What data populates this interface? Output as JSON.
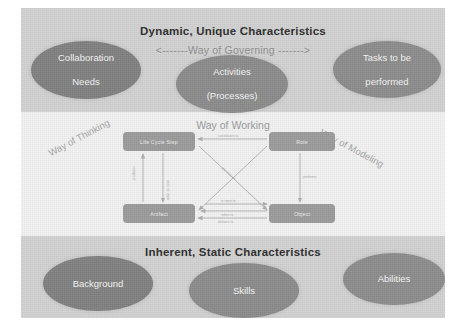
{
  "figure": {
    "bands": [
      {
        "id": "dynamic",
        "title": "Dynamic, Unique Characteristics"
      },
      {
        "id": "middle",
        "title": ""
      },
      {
        "id": "inherent",
        "title": "Inherent, Static Characteristics"
      }
    ],
    "axis_labels": {
      "governing": "<-------Way of Governing ------->",
      "working": "Way of Working",
      "thinking": "Way of Thinking",
      "modeling": "Way of Modeling"
    },
    "top_ellipses": [
      {
        "name": "collaboration-needs",
        "label": "Collaboration Needs",
        "line1": "Collaboration",
        "line2": "Needs",
        "color": "#7f7f7f"
      },
      {
        "name": "activities",
        "label": "Activities (Processes)",
        "line1": "Activities",
        "line2": "(Processes)",
        "color": "#8a8a8a"
      },
      {
        "name": "tasks",
        "label": "Tasks to be performed",
        "line1": "Tasks to be",
        "line2": "performed",
        "color": "#8b8b8b"
      }
    ],
    "bottom_ellipses": [
      {
        "name": "background",
        "label": "Background",
        "color": "#7f7f7f"
      },
      {
        "name": "skills",
        "label": "Skills",
        "color": "#8a8a8a"
      },
      {
        "name": "abilities",
        "label": "Abilities",
        "color": "#8b8b8b"
      }
    ],
    "inner_diagram": {
      "nodes": [
        {
          "name": "life-cycle-step",
          "label": "Life Cycle Step"
        },
        {
          "name": "role",
          "label": "Role"
        },
        {
          "name": "artifact",
          "label": "Artifact"
        },
        {
          "name": "object",
          "label": "Object"
        }
      ],
      "edge_labels": [
        "contributes to",
        "produces",
        "uses as input",
        "performs",
        "operates on",
        "is input to",
        "refers to",
        "delivers to"
      ]
    },
    "colors": {
      "page_background": "#ffffff",
      "band_outer": "#d2d2d2",
      "band_middle": "#f2f2f2",
      "ellipse_fill": "#7f7f7f",
      "node_fill": "#9a9a9a",
      "title_text": "#2b2b2b",
      "muted_text": "#9a9a9a"
    }
  }
}
